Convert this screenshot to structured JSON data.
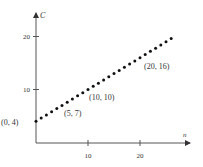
{
  "chart_data": {
    "type": "scatter",
    "title": "",
    "xlabel": "n",
    "ylabel": "C",
    "xlim": [
      0,
      29
    ],
    "ylim": [
      0,
      24
    ],
    "x_ticks": [
      10,
      20
    ],
    "y_ticks": [
      10,
      20
    ],
    "grid": false,
    "legend": null,
    "series": [
      {
        "name": "C = 4 + 0.6n",
        "x": [
          0,
          1,
          2,
          3,
          4,
          5,
          6,
          7,
          8,
          9,
          10,
          11,
          12,
          13,
          14,
          15,
          16,
          17,
          18,
          19,
          20,
          21,
          22,
          23,
          24,
          25,
          26
        ],
        "y": [
          4,
          4.6,
          5.2,
          5.8,
          6.4,
          7,
          7.6,
          8.2,
          8.8,
          9.4,
          10,
          10.6,
          11.2,
          11.8,
          12.4,
          13,
          13.6,
          14.2,
          14.8,
          15.4,
          16,
          16.6,
          17.2,
          17.8,
          18.4,
          19,
          19.6
        ]
      }
    ],
    "annotations": [
      {
        "text": "(0, 4)",
        "x": 0,
        "y": 4
      },
      {
        "text": "(5, 7)",
        "x": 5,
        "y": 7
      },
      {
        "text": "(10, 10)",
        "x": 10,
        "y": 10
      },
      {
        "text": "(20, 16)",
        "x": 20,
        "y": 16
      }
    ]
  },
  "axes": {
    "x_label": "n",
    "y_label": "C",
    "x_tick_labels": [
      "10",
      "20"
    ],
    "y_tick_labels": [
      "10",
      "20"
    ]
  },
  "colors": {
    "axis": "#555555",
    "dots": "#111111",
    "text": "#333333"
  }
}
